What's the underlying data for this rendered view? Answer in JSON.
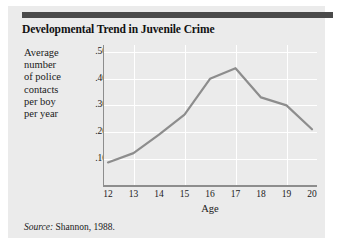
{
  "figure": {
    "title": "Developmental Trend in Juvenile Crime",
    "source_prefix": "Source:",
    "source_text": "Shannon, 1988.",
    "card_color": "#ebebeb",
    "topbar_color": "#4a4a4a",
    "line_color": "#8d8d8d"
  },
  "ylabel_lines": [
    "Average",
    "number",
    "of police",
    "contacts",
    "per boy",
    "per year"
  ],
  "chart_data": {
    "type": "line",
    "title": "Developmental Trend in Juvenile Crime",
    "xlabel": "Age",
    "ylabel": "Average number of police contacts per boy per year",
    "categories": [
      12,
      13,
      14,
      15,
      16,
      17,
      18,
      19,
      20
    ],
    "x": [
      12,
      13,
      14,
      15,
      16,
      17,
      18,
      19,
      20
    ],
    "values": [
      0.085,
      0.12,
      0.19,
      0.265,
      0.4,
      0.44,
      0.33,
      0.3,
      0.21
    ],
    "xtick_labels": [
      "12",
      "13",
      "14",
      "15",
      "16",
      "17",
      "18",
      "19",
      "20"
    ],
    "ytick_labels": [
      ".50",
      ".40",
      ".30",
      ".20",
      ".10"
    ],
    "ytick_values": [
      0.5,
      0.4,
      0.3,
      0.2,
      0.1
    ],
    "xlim": [
      12,
      20
    ],
    "ylim": [
      0,
      0.52
    ],
    "grid": true,
    "grid_color": "#ffffff",
    "legend": "none",
    "series": [
      {
        "name": "Average number of police contacts per boy per year",
        "values": [
          0.085,
          0.12,
          0.19,
          0.265,
          0.4,
          0.44,
          0.33,
          0.3,
          0.21
        ],
        "color": "#8d8d8d"
      }
    ]
  }
}
